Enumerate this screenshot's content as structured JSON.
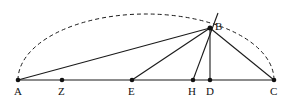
{
  "diagram": {
    "type": "geometry",
    "colors": {
      "stroke": "#1a1a1a",
      "background": "#ffffff"
    },
    "points": {
      "A": {
        "label": "A",
        "x": 18,
        "y": 80
      },
      "Z": {
        "label": "Z",
        "x": 62,
        "y": 80
      },
      "E": {
        "label": "E",
        "x": 132,
        "y": 80
      },
      "H": {
        "label": "H",
        "x": 193,
        "y": 80
      },
      "D": {
        "label": "D",
        "x": 210,
        "y": 80
      },
      "C": {
        "label": "C",
        "x": 274,
        "y": 80
      },
      "B": {
        "label": "B",
        "x": 210,
        "y": 28
      }
    },
    "segments": [
      [
        "A",
        "C"
      ],
      [
        "A",
        "B"
      ],
      [
        "E",
        "B"
      ],
      [
        "H",
        "B"
      ],
      [
        "D",
        "B"
      ],
      [
        "B",
        "C"
      ]
    ],
    "extensions": [
      {
        "from": "H",
        "through": "B",
        "end": {
          "x": 218,
          "y": 13
        }
      }
    ],
    "arcs": [
      {
        "from": "A",
        "to": "C",
        "style": "dashed",
        "through": "B"
      }
    ]
  }
}
